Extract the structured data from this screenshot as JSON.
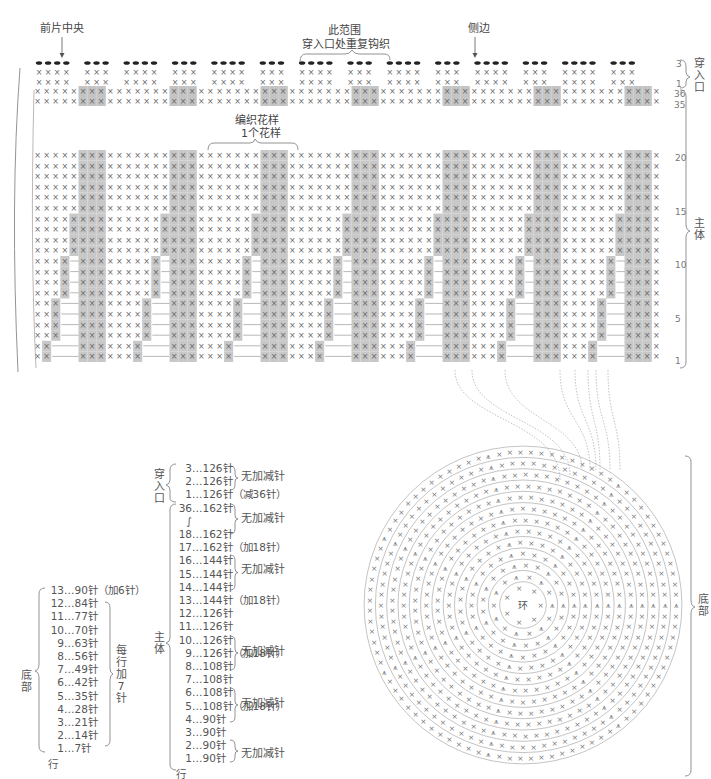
{
  "chart_top": {
    "labels": {
      "front_center": "前片中央",
      "repeat_range_line1": "此范围",
      "repeat_range_line2": "穿入口处重复钩织",
      "side": "侧边",
      "pattern_line1": "编织花样",
      "pattern_line2": "1个花样"
    },
    "section_labels": {
      "opening": "穿入口",
      "body": "主体",
      "bottom": "底部"
    },
    "row_numbers_opening": [
      "3",
      "1"
    ],
    "row_numbers_body_top": [
      "36",
      "35"
    ],
    "row_numbers_body": [
      "20",
      "15",
      "10",
      "5",
      "1"
    ],
    "colors": {
      "shade": "#c8c8c8",
      "shade_dark": "#b4b4b4",
      "stitch": "#666666",
      "line": "#999999"
    }
  },
  "bottom_list": {
    "section": "底部",
    "rows": [
      {
        "row": "13",
        "count": "…90针",
        "note": "（加6针）"
      },
      {
        "row": "12",
        "count": "…84针"
      },
      {
        "row": "11",
        "count": "…77针"
      },
      {
        "row": "10",
        "count": "…70针"
      },
      {
        "row": "9",
        "count": "…63针"
      },
      {
        "row": "8",
        "count": "…56针"
      },
      {
        "row": "7",
        "count": "…49针"
      },
      {
        "row": "6",
        "count": "…42针"
      },
      {
        "row": "5",
        "count": "…35针"
      },
      {
        "row": "4",
        "count": "…28针"
      },
      {
        "row": "3",
        "count": "…21针"
      },
      {
        "row": "2",
        "count": "…14针"
      },
      {
        "row": "1",
        "count": "…7针"
      }
    ],
    "group_note": "每行加7针",
    "row_label": "行"
  },
  "body_list": {
    "opening_section": "穿入口",
    "body_section": "主体",
    "opening_rows": [
      {
        "row": "3",
        "count": "…126针"
      },
      {
        "row": "2",
        "count": "…126针"
      },
      {
        "row": "1",
        "count": "…126针",
        "note": "（减36针）"
      }
    ],
    "body_rows": [
      {
        "row": "36",
        "count": "…162针"
      },
      {
        "row": "∫",
        "count": ""
      },
      {
        "row": "18",
        "count": "…162针"
      },
      {
        "row": "17",
        "count": "…162针",
        "note": "（加18针）"
      },
      {
        "row": "16",
        "count": "…144针"
      },
      {
        "row": "15",
        "count": "…144针"
      },
      {
        "row": "14",
        "count": "…144针"
      },
      {
        "row": "13",
        "count": "…144针",
        "note": "（加18针）"
      },
      {
        "row": "12",
        "count": "…126针"
      },
      {
        "row": "11",
        "count": "…126针"
      },
      {
        "row": "10",
        "count": "…126针"
      },
      {
        "row": "9",
        "count": "…126针",
        "note": "（加18针）"
      },
      {
        "row": "8",
        "count": "…108针"
      },
      {
        "row": "7",
        "count": "…108针"
      },
      {
        "row": "6",
        "count": "…108针"
      },
      {
        "row": "5",
        "count": "…108针",
        "note": "（加18针）"
      },
      {
        "row": "4",
        "count": "…90针"
      },
      {
        "row": "3",
        "count": "…90针"
      },
      {
        "row": "2",
        "count": "…90针"
      },
      {
        "row": "1",
        "count": "…90针"
      }
    ],
    "no_change_label": "无加减针",
    "row_label": "行"
  },
  "circle": {
    "center_label": "环",
    "round_numbers": [
      "2",
      "3",
      "4",
      "5",
      "6",
      "7",
      "8",
      "9",
      "10",
      "11",
      "12",
      "13"
    ]
  }
}
